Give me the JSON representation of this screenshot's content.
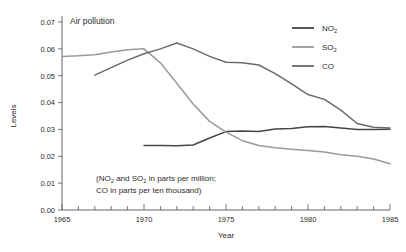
{
  "chart_data": {
    "type": "line",
    "title": "Air pollution",
    "xlabel": "Year",
    "ylabel": "Levels",
    "xlim": [
      1965,
      1985
    ],
    "ylim": [
      0.0,
      0.07
    ],
    "grid": false,
    "legend_position": "top-right",
    "x_tick_labels": [
      "1965",
      "1970",
      "1975",
      "1980",
      "1985"
    ],
    "x_tick_values": [
      1965,
      1970,
      1975,
      1980,
      1985
    ],
    "x_minor_step": 1,
    "y_tick_labels": [
      "0.00",
      "0.01",
      "0.02",
      "0.03",
      "0.04",
      "0.05",
      "0.06",
      "0.07"
    ],
    "y_tick_values": [
      0.0,
      0.01,
      0.02,
      0.03,
      0.04,
      0.05,
      0.06,
      0.07
    ],
    "annotation": "(NO2 and SO2 in parts per million;",
    "annotation_line1": "(NO",
    "annotation_line1_sub": "2",
    "annotation_line1_mid": " and SO",
    "annotation_line1_sub2": "2",
    "annotation_line1_end": " in parts per million;",
    "annotation_line2": "CO in parts per ten thousand)",
    "series": [
      {
        "name": "NO2",
        "name_base": "NO",
        "name_sub": "2",
        "color": "#454545",
        "x": [
          1970,
          1971,
          1972,
          1973,
          1974,
          1975,
          1976,
          1977,
          1978,
          1979,
          1980,
          1981,
          1982,
          1983,
          1984,
          1985
        ],
        "values": [
          0.024,
          0.024,
          0.0239,
          0.0242,
          0.0268,
          0.0292,
          0.0294,
          0.0292,
          0.0302,
          0.0303,
          0.031,
          0.0311,
          0.0305,
          0.03,
          0.03,
          0.0301
        ]
      },
      {
        "name": "SO2",
        "name_base": "SO",
        "name_sub": "2",
        "color": "#9a9a9a",
        "x": [
          1965,
          1966,
          1967,
          1968,
          1969,
          1970,
          1971,
          1972,
          1973,
          1974,
          1975,
          1976,
          1977,
          1978,
          1979,
          1980,
          1981,
          1982,
          1983,
          1984,
          1985
        ],
        "values": [
          0.0572,
          0.0574,
          0.0578,
          0.0588,
          0.0597,
          0.06,
          0.0548,
          0.0472,
          0.0395,
          0.033,
          0.029,
          0.0258,
          0.024,
          0.0232,
          0.0226,
          0.0222,
          0.0216,
          0.0206,
          0.02,
          0.019,
          0.0172
        ]
      },
      {
        "name": "CO",
        "name_base": "CO",
        "name_sub": "",
        "color": "#6a6a6a",
        "x": [
          1967,
          1968,
          1969,
          1970,
          1971,
          1972,
          1973,
          1974,
          1975,
          1976,
          1977,
          1978,
          1979,
          1980,
          1981,
          1982,
          1983,
          1984,
          1985
        ],
        "values": [
          0.0502,
          0.053,
          0.0558,
          0.0582,
          0.06,
          0.0622,
          0.06,
          0.0572,
          0.055,
          0.0548,
          0.054,
          0.0508,
          0.047,
          0.043,
          0.0412,
          0.0372,
          0.0322,
          0.0308,
          0.0305
        ]
      }
    ]
  }
}
